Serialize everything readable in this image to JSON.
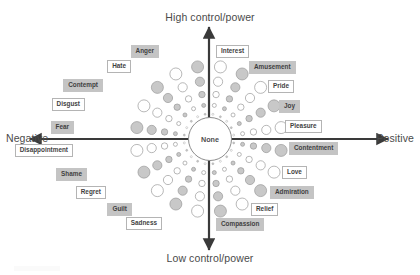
{
  "diagram": {
    "type": "emotion-wheel",
    "center": {
      "label": "None"
    },
    "axes": {
      "top": "High control/power",
      "bottom": "Low control/power",
      "left": "Negative",
      "right": "Positive"
    },
    "colors": {
      "shaded_fill": "#c4c4c4",
      "plain_fill": "#ffffff",
      "border": "#b4b4b4",
      "circle_fill": "#c8c8c8",
      "circle_stroke": "#9a9a9a",
      "axis": "#3a3a3a",
      "text": "#3f3f3f"
    },
    "spokes": [
      {
        "label": "Anger",
        "angle": 99,
        "style": "shaded",
        "side": "left",
        "lx": 159,
        "ly": 45
      },
      {
        "label": "Interest",
        "angle": 81,
        "style": "plain",
        "side": "right",
        "lx": 216,
        "ly": 45
      },
      {
        "label": "Hate",
        "angle": 117,
        "style": "plain",
        "side": "left",
        "lx": 131,
        "ly": 60
      },
      {
        "label": "Amusement",
        "angle": 63,
        "style": "shaded",
        "side": "right",
        "lx": 249,
        "ly": 61
      },
      {
        "label": "Contempt",
        "angle": 135,
        "style": "shaded",
        "side": "left",
        "lx": 103,
        "ly": 79
      },
      {
        "label": "Pride",
        "angle": 45,
        "style": "plain",
        "side": "right",
        "lx": 268,
        "ly": 80
      },
      {
        "label": "Disgust",
        "angle": 153,
        "style": "plain",
        "side": "left",
        "lx": 85,
        "ly": 98
      },
      {
        "label": "Joy",
        "angle": 27,
        "style": "shaded",
        "side": "right",
        "lx": 279,
        "ly": 100
      },
      {
        "label": "Fear",
        "angle": 171,
        "style": "shaded",
        "side": "left",
        "lx": 74,
        "ly": 121
      },
      {
        "label": "Pleasure",
        "angle": 9,
        "style": "plain",
        "side": "right",
        "lx": 285,
        "ly": 120
      },
      {
        "label": "Disappointment",
        "angle": 189,
        "style": "plain",
        "side": "left",
        "lx": 73,
        "ly": 144
      },
      {
        "label": "Contentment",
        "angle": 351,
        "style": "shaded",
        "side": "right",
        "lx": 289,
        "ly": 142
      },
      {
        "label": "Shame",
        "angle": 207,
        "style": "shaded",
        "side": "left",
        "lx": 87,
        "ly": 168
      },
      {
        "label": "Love",
        "angle": 333,
        "style": "plain",
        "side": "right",
        "lx": 282,
        "ly": 166
      },
      {
        "label": "Regret",
        "angle": 225,
        "style": "plain",
        "side": "left",
        "lx": 106,
        "ly": 186
      },
      {
        "label": "Admiration",
        "angle": 315,
        "style": "shaded",
        "side": "right",
        "lx": 270,
        "ly": 186
      },
      {
        "label": "Guilt",
        "angle": 243,
        "style": "shaded",
        "side": "left",
        "lx": 132,
        "ly": 203
      },
      {
        "label": "Relief",
        "angle": 297,
        "style": "plain",
        "side": "right",
        "lx": 251,
        "ly": 203
      },
      {
        "label": "Sadness",
        "angle": 261,
        "style": "plain",
        "side": "left",
        "lx": 162,
        "ly": 217
      },
      {
        "label": "Compassion",
        "angle": 279,
        "style": "shaded",
        "side": "right",
        "lx": 216,
        "ly": 218
      }
    ],
    "spoke_geometry": {
      "center_x": 209,
      "center_y": 139,
      "dot_count": 5,
      "dot_radii": [
        1.0,
        2.0,
        3.2,
        4.6,
        6.0
      ],
      "dot_distances": [
        25,
        34,
        45,
        58,
        73
      ]
    },
    "axis_geometry": {
      "horizontal": {
        "x1": 30,
        "x2": 388,
        "y": 139
      },
      "vertical": {
        "y1": 27,
        "y2": 250,
        "x": 209
      }
    }
  }
}
